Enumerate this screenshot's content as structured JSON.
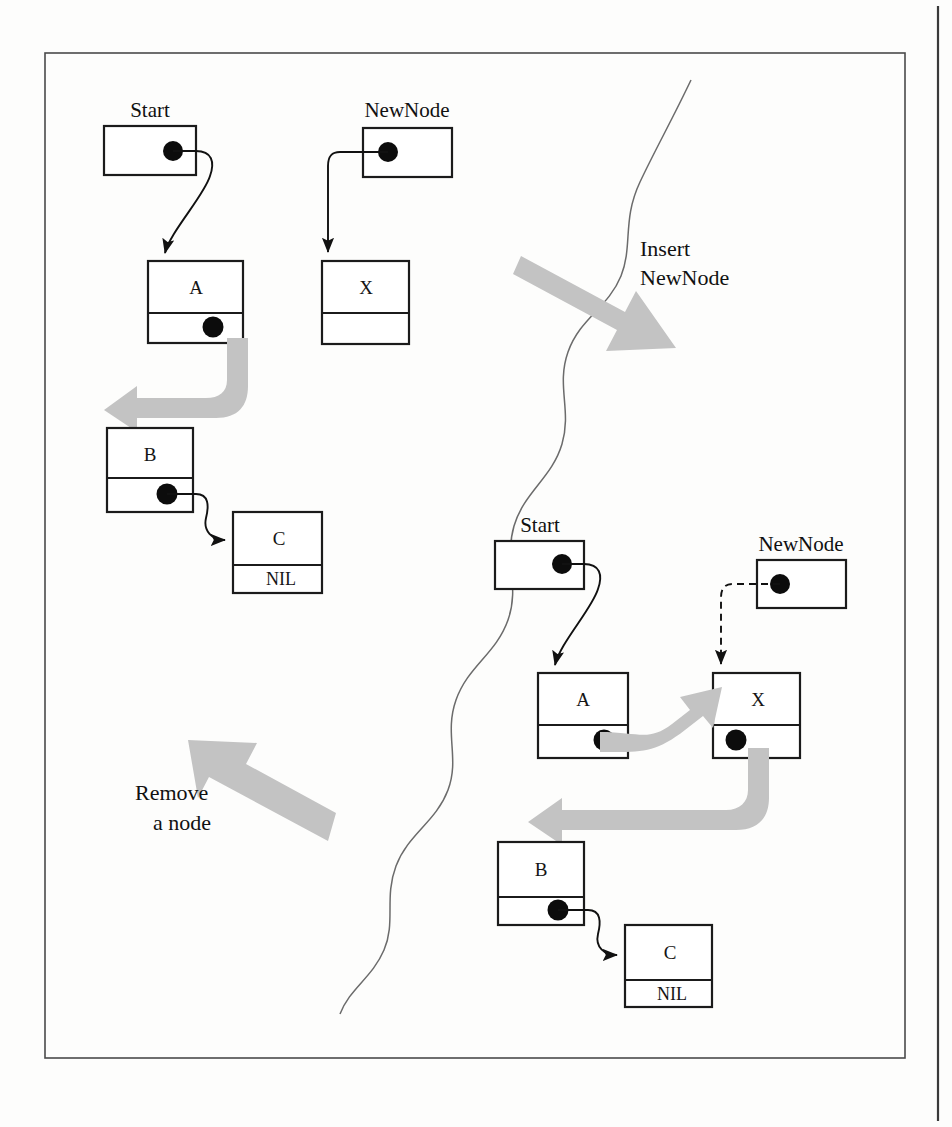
{
  "figure": {
    "colors": {
      "node_stroke": "#1b1b1b",
      "node_fill": "#ffffff",
      "pointer_dot": "#0c0c0c",
      "fat_arrow": "#c3c3c3",
      "wavy_divider": "#6b6b6b",
      "frame": "#4a4a4a",
      "text": "#111111"
    }
  },
  "captions": [
    {
      "id": "insert",
      "line1": "Insert",
      "line2": "NewNode"
    },
    {
      "id": "remove",
      "line1": "Remove",
      "line2": "a node"
    }
  ],
  "panels": {
    "before": {
      "name": "before-insert",
      "variables": [
        {
          "id": "start",
          "label": "Start"
        },
        {
          "id": "newnode",
          "label": "NewNode"
        }
      ],
      "nodes": [
        {
          "id": "a",
          "value": "A",
          "next": "pointer"
        },
        {
          "id": "x",
          "value": "X",
          "next": ""
        },
        {
          "id": "b",
          "value": "B",
          "next": "pointer"
        },
        {
          "id": "c",
          "value": "C",
          "next": "NIL"
        }
      ]
    },
    "after": {
      "name": "after-insert",
      "variables": [
        {
          "id": "start",
          "label": "Start"
        },
        {
          "id": "newnode",
          "label": "NewNode"
        }
      ],
      "nodes": [
        {
          "id": "a",
          "value": "A",
          "next": "pointer"
        },
        {
          "id": "x",
          "value": "X",
          "next": "pointer"
        },
        {
          "id": "b",
          "value": "B",
          "next": "pointer"
        },
        {
          "id": "c",
          "value": "C",
          "next": "NIL"
        }
      ]
    }
  },
  "labels": {
    "nil": "NIL",
    "start": "Start",
    "newnode": "NewNode",
    "a": "A",
    "b": "B",
    "c": "C",
    "x": "X"
  }
}
